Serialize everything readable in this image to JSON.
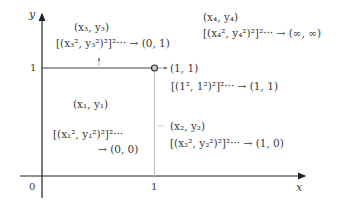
{
  "axes": {
    "x_label": "x",
    "y_label": "y",
    "origin_label": "0",
    "x_tick_1": "1",
    "y_tick_1": "1"
  },
  "regions": [
    {
      "name": "region-1",
      "point": "(x₁, y₁)",
      "expr": "[(x₁², y₁²)²]²···",
      "limit": "→ (0, 0)"
    },
    {
      "name": "region-2",
      "point": "(x₂, y₂)",
      "expr": "[(x₂², y₂²)²]²··· → (1, 0)"
    },
    {
      "name": "region-3",
      "point": "(x₃, y₃)",
      "expr": "[(x₃², y₃²)²]²··· → (0, 1)"
    },
    {
      "name": "region-4",
      "point": "(x₄, y₄)",
      "expr": "[(x₄², y₄²)²]²··· → (∞, ∞)"
    }
  ],
  "fixed_point": {
    "point": "(1, 1)",
    "expr": "[(1², 1²)²]²··· → (1, 1)"
  },
  "colors": {
    "axis": "#333333",
    "boundary_light": "#bbbbbb",
    "text": "#3a3a3a"
  }
}
